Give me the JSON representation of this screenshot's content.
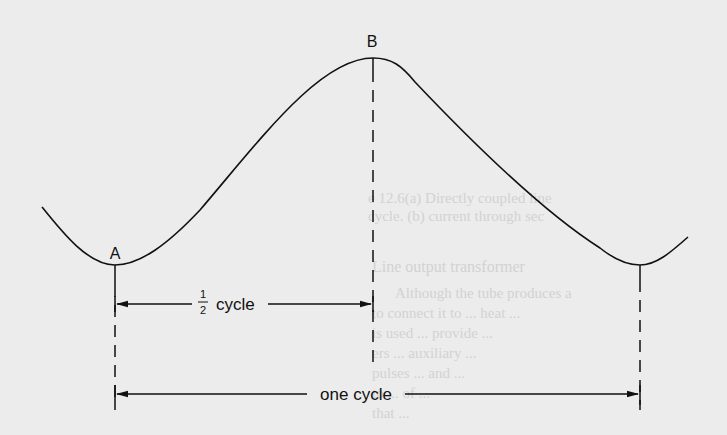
{
  "diagram": {
    "labels": {
      "point_a": "A",
      "point_b": "B",
      "half_cycle_num": "1",
      "half_cycle_den": "2",
      "half_cycle_text": "cycle",
      "one_cycle": "one cycle"
    },
    "colors": {
      "background": "#ececec",
      "ink": "#111111",
      "ghost_text": "#d2d2d2"
    },
    "points": {
      "start": [
        42,
        207
      ],
      "A": [
        115,
        265
      ],
      "B": [
        373,
        58
      ],
      "C": [
        640,
        265
      ],
      "end": [
        688,
        237
      ]
    },
    "markers": {
      "dashed_x": [
        115,
        373,
        640
      ],
      "half_cycle_arrow_y": 304,
      "one_cycle_arrow_y": 394
    }
  },
  "background_text": [
    "e 12.6(a) Directly coupled line",
    "cycle. (b) current through sec",
    "Line output transformer",
    "Although the tube produces a",
    "to connect it to ... heat ...",
    "is used ... provide ...",
    "ers ... auxiliary ...",
    "pulses ... and ...",
    "to ... of ...",
    "that ... "
  ]
}
